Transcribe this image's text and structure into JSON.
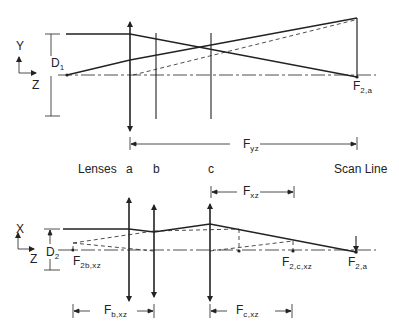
{
  "colors": {
    "line": "#222222",
    "dashed": "#444444",
    "background": "#ffffff"
  },
  "top_view": {
    "axis_y_label": "Y",
    "axis_z_label": "Z",
    "aperture_label": {
      "main": "D",
      "sub": "1"
    },
    "focus_label": {
      "main": "F",
      "sub": "2,a"
    },
    "distance_label": {
      "main": "F",
      "sub": "yz"
    }
  },
  "row_labels": {
    "lenses": "Lenses",
    "a": "a",
    "b": "b",
    "c": "c",
    "scan_line": "Scan Line"
  },
  "bottom_view": {
    "axis_x_label": "X",
    "axis_z_label": "Z",
    "aperture_label": {
      "main": "D",
      "sub": "2"
    },
    "focus_b_label": {
      "main": "F",
      "sub": "2b,xz"
    },
    "focus_c_label": {
      "main": "F",
      "sub": "2,c,xz"
    },
    "focus_a_label": {
      "main": "F",
      "sub": "2,a"
    },
    "fxz_label": {
      "main": "F",
      "sub": "xz"
    },
    "fbxz_label": {
      "main": "F",
      "sub": "b,xz"
    },
    "fcxz_label": {
      "main": "F",
      "sub": "c,xz"
    }
  }
}
